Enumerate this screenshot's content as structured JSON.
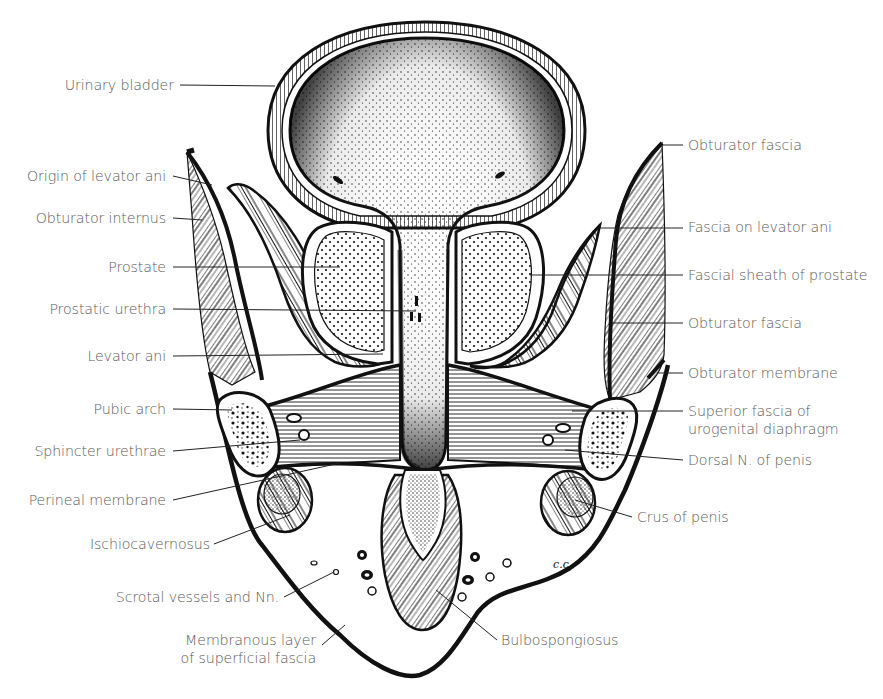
{
  "figure": {
    "initials": "C.C."
  },
  "labels_left": [
    {
      "id": "urinary-bladder",
      "text": "Urinary bladder",
      "x": 174,
      "y": 85
    },
    {
      "id": "origin-of-levator-ani",
      "text": "Origin of levator ani",
      "x": 166,
      "y": 176
    },
    {
      "id": "obturator-internus",
      "text": "Obturator internus",
      "x": 166,
      "y": 218
    },
    {
      "id": "prostate",
      "text": "Prostate",
      "x": 166,
      "y": 267
    },
    {
      "id": "prostatic-urethra",
      "text": "Prostatic urethra",
      "x": 166,
      "y": 309
    },
    {
      "id": "levator-ani",
      "text": "Levator ani",
      "x": 166,
      "y": 356
    },
    {
      "id": "pubic-arch",
      "text": "Pubic arch",
      "x": 166,
      "y": 409
    },
    {
      "id": "sphincter-urethrae",
      "text": "Sphincter urethrae",
      "x": 166,
      "y": 451
    },
    {
      "id": "perineal-membrane",
      "text": "Perineal membrane",
      "x": 166,
      "y": 500
    },
    {
      "id": "ischiocavernosus",
      "text": "Ischiocavernosus",
      "x": 210,
      "y": 544
    },
    {
      "id": "scrotal-vessels",
      "text": "Scrotal vessels and Nn.",
      "x": 279,
      "y": 597
    },
    {
      "id": "membranous-layer",
      "text": "Membranous layer",
      "text2": "of superficial fascia",
      "x": 316,
      "y": 640
    }
  ],
  "labels_right": [
    {
      "id": "obturator-fascia-upper",
      "text": "Obturator fascia",
      "x": 688,
      "y": 145
    },
    {
      "id": "fascia-on-levator-ani",
      "text": "Fascia on levator ani",
      "x": 688,
      "y": 227
    },
    {
      "id": "fascial-sheath-of-prostate",
      "text": "Fascial sheath of prostate",
      "x": 688,
      "y": 276
    },
    {
      "id": "obturator-fascia-lower",
      "text": "Obturator fascia",
      "x": 688,
      "y": 324
    },
    {
      "id": "obturator-membrane",
      "text": "Obturator membrane",
      "x": 688,
      "y": 374
    },
    {
      "id": "superior-fascia-urogenital",
      "text": "Superior fascia of",
      "text2": "urogenital diaphragm",
      "x": 688,
      "y": 410
    },
    {
      "id": "dorsal-n-of-penis",
      "text": "Dorsal N. of penis",
      "x": 688,
      "y": 460
    },
    {
      "id": "crus-of-penis",
      "text": "Crus of penis",
      "x": 637,
      "y": 517
    },
    {
      "id": "bulbospongiosus",
      "text": "Bulbospongiosus",
      "x": 500,
      "y": 640
    }
  ],
  "colors": {
    "ink": "#111111",
    "label_text": "#5a5a5a",
    "leader": "#222222",
    "paper": "#ffffff"
  }
}
